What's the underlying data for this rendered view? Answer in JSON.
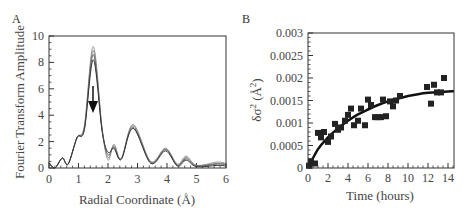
{
  "chart_data": [
    {
      "panel": "A",
      "type": "line",
      "title": "",
      "xlabel": "Radial Coordinate (Å)",
      "ylabel": "Fourier Transform Amplitude",
      "xlim": [
        0,
        6
      ],
      "ylim": [
        0,
        10
      ],
      "xticks": [
        "0",
        "1",
        "2",
        "3",
        "4",
        "5",
        "6"
      ],
      "yticks": [
        "0",
        "2",
        "4",
        "6",
        "8",
        "10"
      ],
      "grid": false,
      "annotation": "downward arrow at R≈1.5 Å, amplitude ≈6.2 → 4.2, indicating decreasing first-shell peak",
      "series": [
        {
          "name": "curve-1",
          "color": "#999999",
          "x": [
            0,
            0.2,
            0.45,
            0.65,
            0.95,
            1.2,
            1.5,
            1.8,
            2.0,
            2.2,
            2.45,
            2.85,
            3.45,
            3.95,
            4.35,
            4.65,
            5.0,
            5.7,
            6.0
          ],
          "y": [
            0.4,
            0.0,
            0.75,
            0.3,
            2.3,
            3.2,
            9.2,
            3.0,
            0.6,
            1.8,
            0.7,
            3.3,
            0.5,
            1.5,
            0.3,
            0.9,
            0.2,
            0.45,
            0.35
          ]
        },
        {
          "name": "curve-2",
          "color": "#888888",
          "x": [
            0,
            0.2,
            0.45,
            0.65,
            0.95,
            1.2,
            1.5,
            1.8,
            2.0,
            2.2,
            2.45,
            2.85,
            3.45,
            3.95,
            4.35,
            4.65,
            5.0,
            5.7,
            6.0
          ],
          "y": [
            0.4,
            0.0,
            0.75,
            0.3,
            2.3,
            3.1,
            8.9,
            2.9,
            0.8,
            1.7,
            0.7,
            3.2,
            0.45,
            1.45,
            0.25,
            0.8,
            0.2,
            0.35,
            0.3
          ]
        },
        {
          "name": "curve-3",
          "color": "#666666",
          "x": [
            0,
            0.2,
            0.45,
            0.65,
            0.95,
            1.2,
            1.5,
            1.8,
            2.0,
            2.2,
            2.45,
            2.85,
            3.45,
            3.95,
            4.35,
            4.65,
            5.0,
            5.7,
            6.0
          ],
          "y": [
            0.4,
            0.0,
            0.75,
            0.3,
            2.3,
            3.0,
            8.6,
            2.9,
            1.0,
            1.6,
            0.7,
            3.1,
            0.4,
            1.4,
            0.2,
            0.7,
            0.15,
            0.3,
            0.25
          ]
        },
        {
          "name": "curve-4",
          "color": "#333333",
          "x": [
            0,
            0.2,
            0.45,
            0.65,
            0.95,
            1.2,
            1.5,
            1.8,
            2.0,
            2.2,
            2.45,
            2.85,
            3.45,
            3.95,
            4.35,
            4.65,
            5.0,
            5.7,
            6.0
          ],
          "y": [
            0.4,
            0.0,
            0.75,
            0.3,
            2.3,
            2.9,
            8.2,
            2.8,
            1.2,
            1.5,
            0.65,
            3.0,
            0.35,
            1.3,
            0.15,
            0.6,
            0.1,
            0.2,
            0.15
          ]
        }
      ]
    },
    {
      "panel": "B",
      "type": "scatter",
      "title": "",
      "xlabel": "Time (hours)",
      "ylabel": "δσ² (Å²)",
      "xlim": [
        0,
        15
      ],
      "ylim": [
        0,
        0.003
      ],
      "xticks": [
        "0",
        "2",
        "4",
        "6",
        "8",
        "10",
        "12",
        "14"
      ],
      "yticks": [
        "0",
        "0.0005",
        "0.001",
        "0.0015",
        "0.002",
        "0.0025",
        "0.003"
      ],
      "grid": false,
      "series": [
        {
          "name": "data",
          "marker": "square",
          "color": "#222222",
          "x": [
            0.1,
            0.3,
            0.7,
            1.0,
            1.3,
            1.6,
            2.0,
            2.3,
            2.7,
            3.0,
            3.3,
            3.7,
            4.0,
            4.3,
            4.6,
            5.0,
            5.3,
            5.7,
            6.0,
            6.3,
            6.7,
            7.0,
            7.3,
            7.5,
            7.8,
            8.2,
            8.5,
            8.8,
            9.2,
            11.9,
            12.3,
            12.6,
            12.9,
            13.3,
            13.6
          ],
          "y": [
            5e-05,
            0.00015,
            0.0001,
            0.00078,
            0.00068,
            0.0008,
            0.00058,
            0.0007,
            0.00098,
            0.00085,
            0.0009,
            0.00105,
            0.00118,
            0.00132,
            0.00095,
            0.00105,
            0.00132,
            0.00095,
            0.00152,
            0.0014,
            0.00113,
            0.00113,
            0.00113,
            0.00152,
            0.00115,
            0.00148,
            0.00137,
            0.0015,
            0.0016,
            0.0018,
            0.00143,
            0.00185,
            0.00168,
            0.00168,
            0.002
          ]
        },
        {
          "name": "fit",
          "type": "line",
          "color": "#111111",
          "x": [
            0,
            1,
            2,
            3,
            4,
            5,
            6,
            7,
            8,
            9,
            10,
            11,
            12,
            13,
            14,
            15
          ],
          "y": [
            0.0,
            0.00042,
            0.00068,
            0.00088,
            0.00105,
            0.00119,
            0.0013,
            0.0014,
            0.00148,
            0.00154,
            0.0016,
            0.00164,
            0.00167,
            0.00169,
            0.0017,
            0.00171
          ]
        }
      ]
    }
  ],
  "panels": {
    "a": {
      "label": "A",
      "xlabel": "Radial Coordinate (Å)",
      "ylabel": "Fourier Transform Amplitude",
      "xticks": [
        "0",
        "1",
        "2",
        "3",
        "4",
        "5",
        "6"
      ],
      "yticks": [
        "0",
        "2",
        "4",
        "6",
        "8",
        "10"
      ]
    },
    "b": {
      "label": "B",
      "xlabel": "Time (hours)",
      "ylabel_main": "δσ",
      "ylabel_sup": "2",
      "ylabel_unit": "(Å",
      "ylabel_unit_sup": "2",
      "ylabel_close": ")",
      "xticks": [
        "0",
        "2",
        "4",
        "6",
        "8",
        "10",
        "12",
        "14"
      ],
      "yticks": [
        "0",
        "0.0005",
        "0.001",
        "0.0015",
        "0.002",
        "0.0025",
        "0.003"
      ]
    }
  }
}
